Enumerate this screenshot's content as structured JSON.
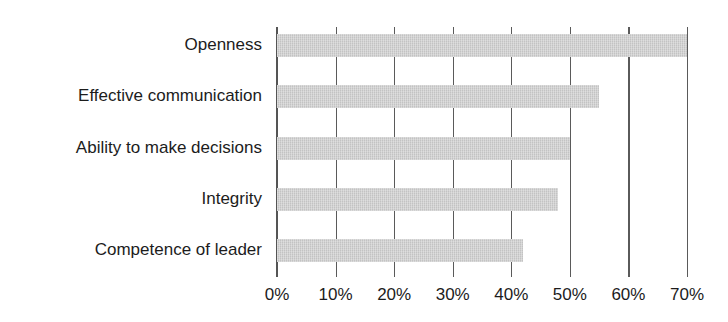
{
  "page": {
    "cropped_header_text": "",
    "background_color": "#ffffff"
  },
  "chart_data": {
    "type": "bar",
    "orientation": "horizontal",
    "title": "",
    "subtitle": "",
    "xlabel": "",
    "ylabel": "",
    "categories": [
      "Openness",
      "Effective communication",
      "Ability to make decisions",
      "Integrity",
      "Competence of leader"
    ],
    "values": [
      70,
      55,
      50,
      48,
      42
    ],
    "value_suffix": "%",
    "xlim": [
      0,
      70
    ],
    "xticks": [
      0,
      10,
      20,
      30,
      40,
      50,
      60,
      70
    ],
    "xtick_labels": [
      "0%",
      "10%",
      "20%",
      "30%",
      "40%",
      "50%",
      "60%",
      "70%"
    ],
    "grid": "vertical",
    "legend": "none",
    "series": [
      {
        "name": "",
        "values": [
          70,
          55,
          50,
          48,
          42
        ],
        "color": "#c3c3c3"
      }
    ],
    "colors": {
      "bar_fill": "#c3c3c3",
      "gridline": "#5a5a5a",
      "axis": "#555555",
      "text": "#1c1c1c",
      "background": "#ffffff"
    }
  }
}
